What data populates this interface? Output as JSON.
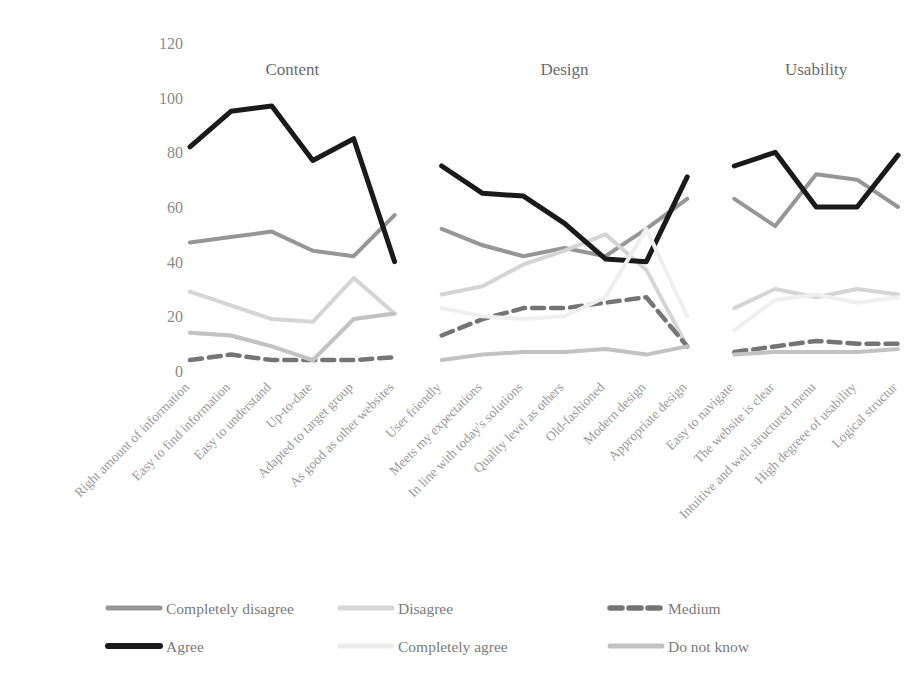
{
  "chart_data": {
    "type": "line",
    "title": "",
    "xlabel": "",
    "ylabel": "",
    "ylim": [
      0,
      120
    ],
    "yticks": [
      0,
      20,
      40,
      60,
      80,
      100,
      120
    ],
    "grid": false,
    "legend_position": "bottom",
    "groups": [
      {
        "name": "Content",
        "categories": [
          "Right amount of information",
          "Easy to find information",
          "Easy to understand",
          "Up-to-date",
          "Adapted to target group",
          "As good as other websites"
        ]
      },
      {
        "name": "Design",
        "categories": [
          "User friendly",
          "Meets my expectations",
          "In line with today's solutions",
          "Quality level as others",
          "Old-fashioned",
          "Modern design",
          "Appropriate design"
        ]
      },
      {
        "name": "Usability",
        "categories": [
          "Easy to navigate",
          "The website is clear",
          "Intuitive and well structured menu",
          "High degreee of usability",
          "Logical structur"
        ]
      }
    ],
    "series": [
      {
        "name": "Completely disagree",
        "color": "#969696",
        "dash": "none",
        "width": 4,
        "values_by_group": {
          "Content": [
            47,
            49,
            51,
            44,
            42,
            57
          ],
          "Design": [
            52,
            46,
            42,
            45,
            42,
            52,
            63
          ],
          "Usability": [
            63,
            53,
            72,
            70,
            60
          ]
        }
      },
      {
        "name": "Disagree",
        "color": "#d5d5d5",
        "dash": "none",
        "width": 4,
        "values_by_group": {
          "Content": [
            29,
            24,
            19,
            18,
            34,
            21,
            36
          ],
          "Design": [
            28,
            31,
            39,
            44,
            50,
            37,
            9
          ],
          "Usability": [
            23,
            30,
            27,
            30,
            28
          ]
        }
      },
      {
        "name": "Medium",
        "color": "#747474",
        "dash": "12 7",
        "width": 4.5,
        "values_by_group": {
          "Content": [
            4,
            6,
            4,
            4,
            4,
            5,
            19
          ],
          "Design": [
            13,
            19,
            23,
            23,
            25,
            27,
            9
          ],
          "Usability": [
            7,
            9,
            11,
            10,
            10
          ]
        }
      },
      {
        "name": "Agree",
        "color": "#1a1a1a",
        "dash": "none",
        "width": 5,
        "values_by_group": {
          "Content": [
            82,
            95,
            97,
            77,
            85,
            40
          ],
          "Design": [
            75,
            65,
            64,
            54,
            41,
            40,
            71
          ],
          "Usability": [
            75,
            80,
            60,
            60,
            79
          ]
        }
      },
      {
        "name": "Completely agree",
        "color": "#efefef",
        "dash": "none",
        "width": 4,
        "values_by_group": {
          "Content": [
            14,
            13,
            9,
            4,
            19,
            21,
            30
          ],
          "Design": [
            23,
            20,
            19,
            20,
            27,
            52,
            20
          ],
          "Usability": [
            15,
            26,
            28,
            25,
            27
          ]
        }
      },
      {
        "name": "Do not know",
        "color": "#c2c2c2",
        "dash": "none",
        "width": 4,
        "values_by_group": {
          "Content": [
            14,
            13,
            9,
            4,
            19,
            21,
            31
          ],
          "Design": [
            4,
            6,
            7,
            7,
            8,
            6,
            9
          ],
          "Usability": [
            6,
            7,
            7,
            7,
            8
          ]
        }
      }
    ]
  },
  "legend": {
    "items": [
      {
        "label": "Completely disagree",
        "color": "#969696"
      },
      {
        "label": "Disagree",
        "color": "#d5d5d5"
      },
      {
        "label": "Medium",
        "color": "#747474"
      },
      {
        "label": "Agree",
        "color": "#1a1a1a"
      },
      {
        "label": "Completely agree",
        "color": "#ececec"
      },
      {
        "label": "Do not know",
        "color": "#c2c2c2"
      }
    ]
  }
}
